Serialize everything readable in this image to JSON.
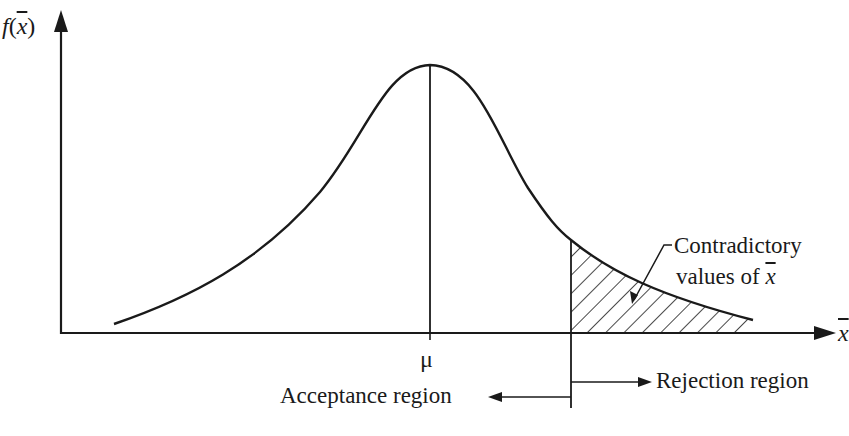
{
  "diagram": {
    "type": "hypothesis-test-normal-distribution",
    "y_axis_label": {
      "func": "f",
      "open": "(",
      "var": "x",
      "close": ")"
    },
    "x_axis_label": {
      "var": "x"
    },
    "mean_label": "μ",
    "annotation": {
      "line1": "Contradictory",
      "line2_prefix": "values of ",
      "line2_var": "x"
    },
    "acceptance_label": "Acceptance region",
    "rejection_label": "Rejection region",
    "colors": {
      "ink": "#1a1a1a",
      "background": "#ffffff"
    }
  }
}
